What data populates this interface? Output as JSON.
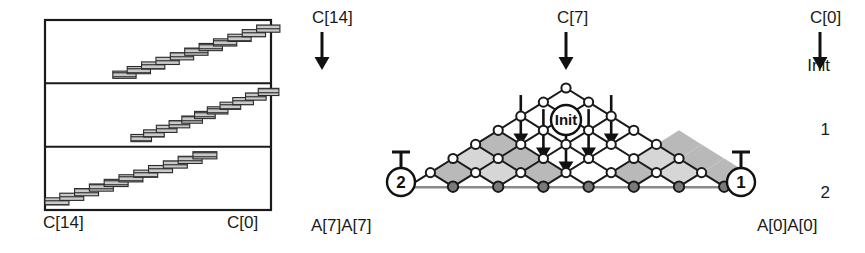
{
  "figure": {
    "left_panel": {
      "name": "staircase-chart",
      "box": {
        "x": 45,
        "y": 20,
        "w": 226,
        "h": 190
      },
      "rows": [
        {
          "label": "Init",
          "steps": 11,
          "dir": "up-right",
          "start_frac": 0.3,
          "end_frac": 1.0
        },
        {
          "label": "1",
          "steps": 11,
          "dir": "up-right",
          "start_frac": 0.38,
          "end_frac": 1.0
        },
        {
          "label": "2",
          "steps": 11,
          "dir": "up-right",
          "start_frac": 0.0,
          "end_frac": 0.72
        }
      ],
      "axis_left_label": "C[14]",
      "axis_right_label": "C[0]"
    },
    "right_panel": {
      "name": "triangular-lattice",
      "top_labels": [
        {
          "text": "C[14]",
          "x": 312,
          "arrow_x": 322
        },
        {
          "text": "C[7]",
          "x": 557,
          "arrow_x": 566
        },
        {
          "text": "C[0]",
          "x": 810,
          "arrow_x": 820
        }
      ],
      "bottom_labels": [
        {
          "text": "A[7]A[7]",
          "x": 311
        },
        {
          "text": "A[0]A[0]",
          "x": 757
        }
      ],
      "markers": [
        {
          "label": "Init",
          "x": 566,
          "y": 120,
          "r": 15
        },
        {
          "label": "2",
          "x": 401,
          "y": 182,
          "r": 14
        },
        {
          "label": "1",
          "x": 741,
          "y": 182,
          "r": 14
        }
      ],
      "rows": 8,
      "bottom_nodes": 8,
      "arrows_count": 5
    },
    "colors": {
      "ink": "#1a1a1a",
      "node_open_fill": "#ffffff",
      "node_filled_fill": "#7a7a7a",
      "shade_light": "#d6d6d6",
      "shade_mid": "#b9b9b9",
      "brick_fill": "#c9c9c9",
      "hatch": "#4a4a4a",
      "baseline": "#8a8a8a"
    }
  }
}
